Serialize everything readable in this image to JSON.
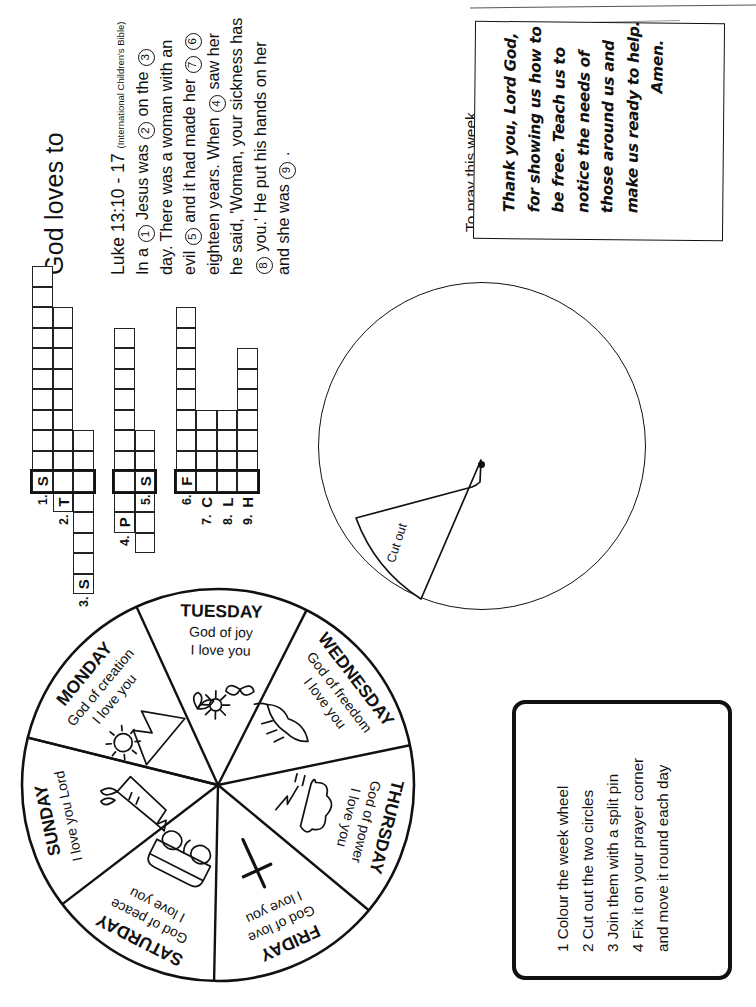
{
  "page": {
    "title": "God loves to",
    "orientation_note": "landscape worksheet printed on portrait page (text rotated 90 degrees)"
  },
  "verse": {
    "reference": "Luke 13:10 - 17",
    "source": "(International Children's Bible)",
    "lines": [
      [
        {
          "t": "text",
          "v": "In a "
        },
        {
          "t": "num",
          "v": "1"
        },
        {
          "t": "text",
          "v": " Jesus was "
        },
        {
          "t": "num",
          "v": "2"
        },
        {
          "t": "text",
          "v": " on the "
        },
        {
          "t": "num",
          "v": "3"
        }
      ],
      [
        {
          "t": "text",
          "v": "day. There was a woman with an"
        }
      ],
      [
        {
          "t": "text",
          "v": "evil "
        },
        {
          "t": "num",
          "v": "5"
        },
        {
          "t": "text",
          "v": " and it had made her "
        },
        {
          "t": "num",
          "v": "7"
        },
        {
          "t": "text",
          "v": " "
        },
        {
          "t": "num",
          "v": "6"
        }
      ],
      [
        {
          "t": "text",
          "v": "eighteen years. When "
        },
        {
          "t": "num",
          "v": "4"
        },
        {
          "t": "text",
          "v": " saw her"
        }
      ],
      [
        {
          "t": "text",
          "v": "he said, 'Woman, your sickness has"
        }
      ],
      [
        {
          "t": "num",
          "v": "8"
        },
        {
          "t": "text",
          "v": " you.' He put his hands on her"
        }
      ],
      [
        {
          "t": "text",
          "v": "and she was "
        },
        {
          "t": "num",
          "v": "9"
        },
        {
          "t": "text",
          "v": " ."
        }
      ]
    ]
  },
  "crossword": {
    "clue_numbers": [
      "1.",
      "2.",
      "3.",
      "4.",
      "5.",
      "6.",
      "7.",
      "8.",
      "9."
    ],
    "given_letters": [
      "S",
      "T",
      "S",
      "P",
      "S",
      "F",
      "C",
      "L",
      "H"
    ],
    "entries": [
      {
        "number": "1.",
        "letter": "S",
        "direction": "across",
        "length": 3
      },
      {
        "number": "2.",
        "letter": "T",
        "direction": "down",
        "length": 6
      },
      {
        "number": "3.",
        "letter": "S",
        "direction": "marker",
        "length": 1
      },
      {
        "number": "4.",
        "letter": "P",
        "direction": "down",
        "length": 4
      },
      {
        "number": "5.",
        "letter": "S",
        "direction": "across",
        "length": 2
      },
      {
        "number": "6.",
        "letter": "F",
        "direction": "across",
        "length": 4
      },
      {
        "number": "7.",
        "letter": "C",
        "direction": "down",
        "length": 5
      },
      {
        "number": "8.",
        "letter": "L",
        "direction": "down",
        "length": 3
      },
      {
        "number": "9.",
        "letter": "H",
        "direction": "down",
        "length": 4
      }
    ]
  },
  "prayer": {
    "label": "To pray this week",
    "lines": [
      "Thank you, Lord God,",
      "for showing us how to",
      "be free. Teach us to",
      "notice the needs of",
      "those around us and",
      "make us ready to help.",
      "Amen."
    ]
  },
  "cut_circle": {
    "wedge_label": "Cut out"
  },
  "instructions": {
    "items": [
      {
        "number": "1",
        "text": "Colour the week wheel"
      },
      {
        "number": "2",
        "text": "Cut out the two circles"
      },
      {
        "number": "3",
        "text": "Join them with a split pin"
      },
      {
        "number": "4",
        "text": "Fix it on your prayer corner"
      },
      {
        "number": "",
        "text": "and move it round each day"
      }
    ]
  },
  "week_wheel": {
    "segments": [
      {
        "day": "MONDAY",
        "attribute": "God of creation",
        "affirmation": "I love you",
        "picture": "sun-and-mountain-icon"
      },
      {
        "day": "TUESDAY",
        "attribute": "God of joy",
        "affirmation": "I love you",
        "picture": "flowers-and-butterfly-icon"
      },
      {
        "day": "WEDNESDAY",
        "attribute": "God of freedom",
        "affirmation": "I love you",
        "picture": "flying-bird-icon"
      },
      {
        "day": "THURSDAY",
        "attribute": "God of power",
        "affirmation": "I love you",
        "picture": "storm-cloud-lightning-icon"
      },
      {
        "day": "FRIDAY",
        "attribute": "God of love",
        "affirmation": "I love you",
        "picture": "cross-icon"
      },
      {
        "day": "SATURDAY",
        "attribute": "God of peace",
        "affirmation": "I love you",
        "picture": "sleeping-bed-icon"
      },
      {
        "day": "SUNDAY",
        "attribute": "",
        "affirmation": "I love you Lord",
        "picture": "church-and-people-icon"
      }
    ]
  },
  "colors": {
    "ink": "#111111",
    "paper": "#ffffff"
  }
}
